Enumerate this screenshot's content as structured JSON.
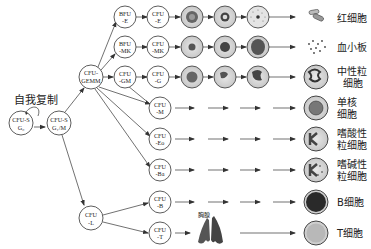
{
  "title": "自我复制",
  "stem": {
    "g0": {
      "line1": "CFU-S",
      "line2": "G₀"
    },
    "g1m": {
      "line1": "CFU-S",
      "line2": "G₁/M"
    }
  },
  "gemm": {
    "line1": "CFU-",
    "line2": "GEMM"
  },
  "lymph": {
    "line1": "CFU",
    "line2": "-L"
  },
  "rows": [
    {
      "prog1": {
        "line1": "BFU",
        "line2": "-E"
      },
      "prog2": {
        "line1": "CFU",
        "line2": "-E"
      },
      "label": [
        "红细胞"
      ]
    },
    {
      "prog1": {
        "line1": "BFU",
        "line2": "-MK"
      },
      "prog2": {
        "line1": "CFU",
        "line2": "-MK"
      },
      "label": [
        "血小板"
      ]
    },
    {
      "prog1": {
        "line1": "CFU",
        "line2": "-GM"
      },
      "prog2": {
        "line1": "CFU",
        "line2": "-G"
      },
      "label": [
        "中性粒",
        "细胞"
      ]
    },
    {
      "prog2": {
        "line1": "CFU",
        "line2": "-M"
      },
      "label": [
        "单核",
        "细胞"
      ]
    },
    {
      "prog2": {
        "line1": "CFU",
        "line2": "-Eo"
      },
      "label": [
        "嗜酸性",
        "粒细胞"
      ]
    },
    {
      "prog2": {
        "line1": "CFU",
        "line2": "-Ba"
      },
      "label": [
        "嗜碱性",
        "粒细胞"
      ]
    },
    {
      "prog2": {
        "line1": "CFU",
        "line2": "-B"
      },
      "label": [
        "B细胞"
      ]
    },
    {
      "prog2": {
        "line1": "CFU",
        "line2": "-T"
      },
      "label": [
        "T细胞"
      ]
    }
  ],
  "thymus_label": "胸腺",
  "colors": {
    "line": "#333333",
    "cell_fill": "#d9d9d9",
    "cell_dark": "#555555"
  }
}
